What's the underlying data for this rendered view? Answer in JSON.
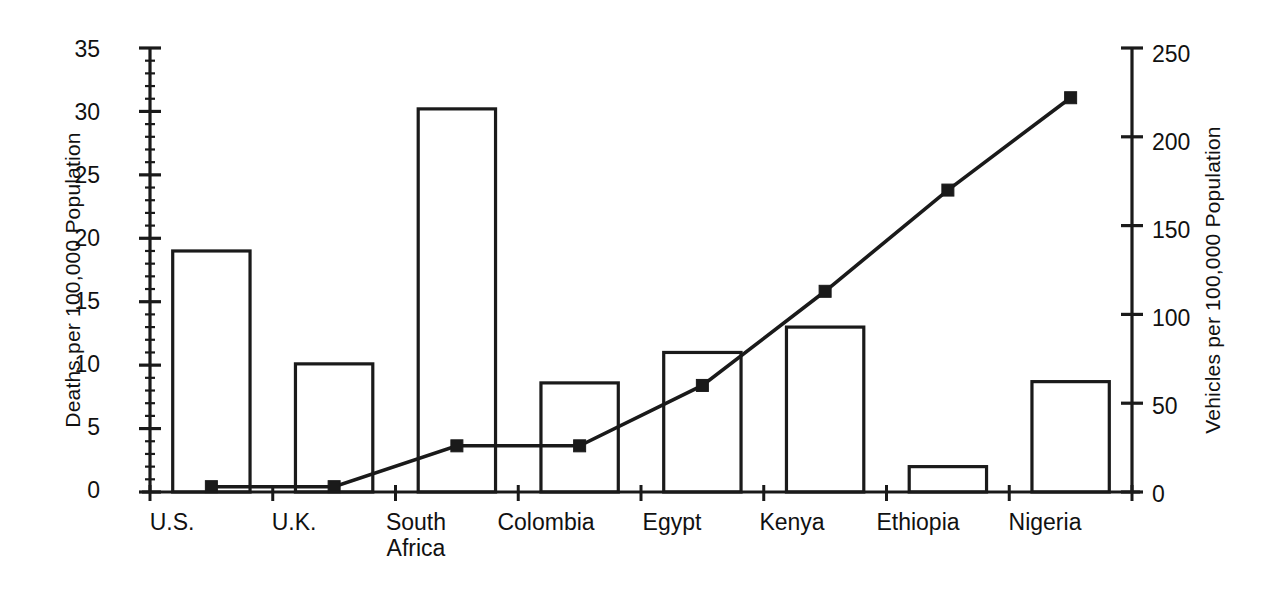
{
  "chart_data": {
    "type": "bar",
    "title": "",
    "subtitle": "",
    "categories": [
      "U.S.",
      "U.K.",
      "South\nAfrica",
      "Colombia",
      "Egypt",
      "Kenya",
      "Ethiopia",
      "Nigeria"
    ],
    "series": [
      {
        "name": "Deaths per 100,000 Population",
        "type": "bar",
        "axis": "left",
        "values": [
          19.0,
          10.1,
          30.2,
          8.6,
          11.0,
          13.0,
          2.0,
          8.7
        ]
      },
      {
        "name": "Vehicles per 100,000 Population",
        "type": "line",
        "axis": "right",
        "marker": "filled-square",
        "values": [
          3,
          3,
          26,
          26,
          60,
          113,
          170,
          222
        ]
      }
    ],
    "xlabel": "",
    "ylabel": "Deaths per 100,000 Population",
    "y2label": "Vehicles per 100,000 Population",
    "ylim": [
      0,
      35
    ],
    "y2lim": [
      0,
      250
    ],
    "yticks": [
      "0",
      "5",
      "10",
      "15",
      "20",
      "25",
      "30",
      "35"
    ],
    "y2ticks": [
      "0",
      "50",
      "100",
      "150",
      "200",
      "250"
    ],
    "grid": false,
    "legend": "none"
  },
  "axes": {
    "left": {
      "title": "Deaths per 100,000 Population",
      "ticks": [
        "35",
        "30",
        "25",
        "20",
        "15",
        "10",
        "5",
        "0"
      ]
    },
    "right": {
      "title": "Vehicles per 100,000 Population",
      "ticks": [
        "250",
        "200",
        "150",
        "100",
        "50",
        "0"
      ]
    }
  },
  "categories": [
    {
      "label": "U.S."
    },
    {
      "label": "U.K."
    },
    {
      "label": "South\nAfrica"
    },
    {
      "label": "Colombia"
    },
    {
      "label": "Egypt"
    },
    {
      "label": "Kenya"
    },
    {
      "label": "Ethiopia"
    },
    {
      "label": "Nigeria"
    }
  ],
  "style": {
    "ink": "#1a1a1a",
    "background": "#ffffff"
  }
}
